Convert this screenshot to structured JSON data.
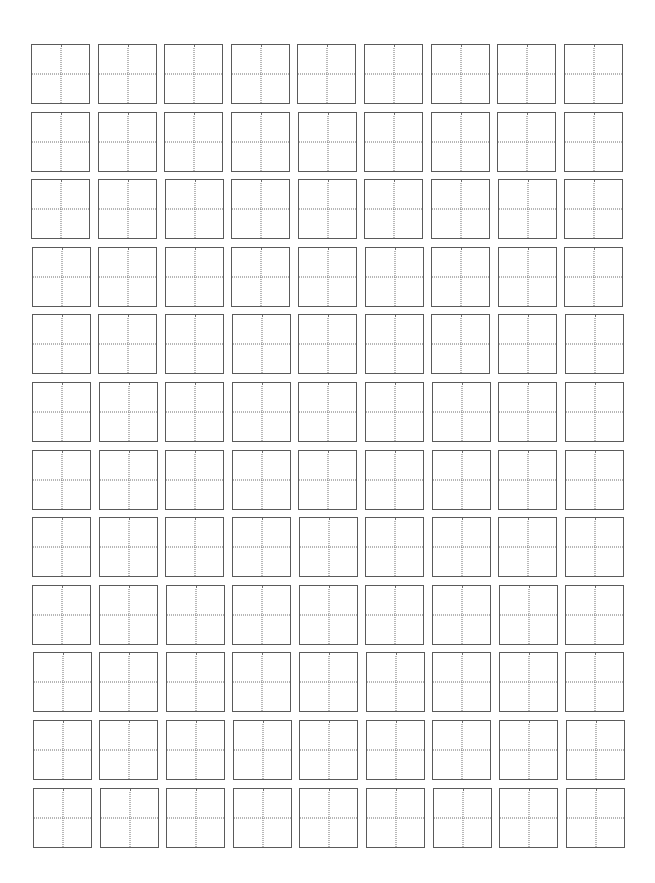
{
  "worksheet": {
    "type": "tianzige-practice-grid",
    "columns": 9,
    "rows": 12,
    "cell_guides": [
      "vertical-center-dotted",
      "horizontal-center-dotted"
    ],
    "colors": {
      "background": "#ffffff",
      "cell_border": "#5a5a5a",
      "guide_line": "#6e6e6e"
    },
    "layout": {
      "origin_x": 31,
      "origin_y": 44,
      "column_pitch": 66.6,
      "row_pitch": 67.6,
      "cell_width": 59,
      "cell_height": 60
    }
  }
}
